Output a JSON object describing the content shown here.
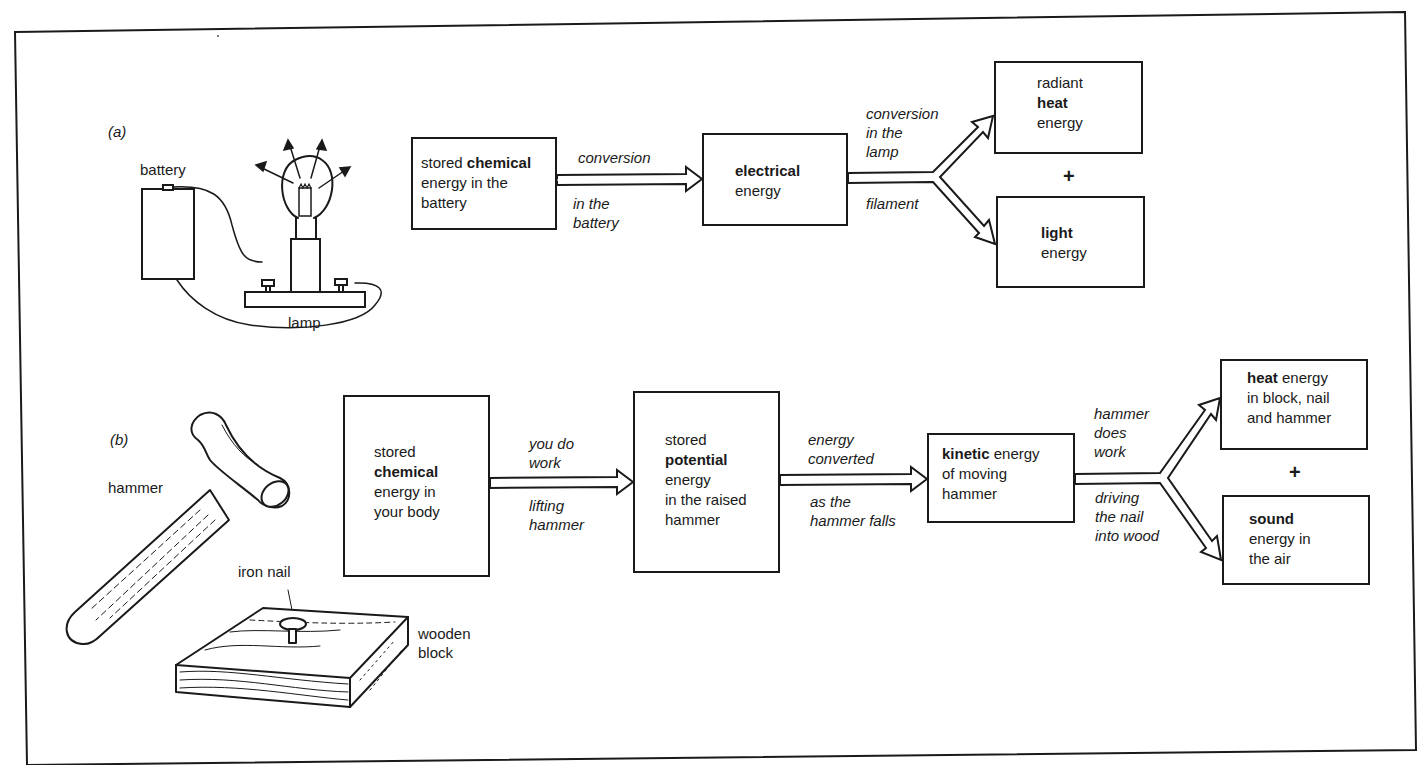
{
  "figure": {
    "part_a": {
      "label": "(a)",
      "apparatus_labels": {
        "battery": "battery",
        "lamp": "lamp"
      },
      "boxes": [
        {
          "id": "a1",
          "lines": [
            {
              "pre": "stored ",
              "bold": "chemical",
              "post": ""
            },
            {
              "pre": "energy in the",
              "bold": "",
              "post": ""
            },
            {
              "pre": "battery",
              "bold": "",
              "post": ""
            }
          ]
        },
        {
          "id": "a2",
          "lines": [
            {
              "pre": "",
              "bold": "electrical",
              "post": ""
            },
            {
              "pre": "energy",
              "bold": "",
              "post": ""
            }
          ]
        },
        {
          "id": "a3",
          "lines": [
            {
              "pre": "radiant",
              "bold": "",
              "post": ""
            },
            {
              "pre": "",
              "bold": "heat",
              "post": ""
            },
            {
              "pre": "energy",
              "bold": "",
              "post": ""
            }
          ]
        },
        {
          "id": "a4",
          "lines": [
            {
              "pre": "",
              "bold": "light",
              "post": ""
            },
            {
              "pre": "energy",
              "bold": "",
              "post": ""
            }
          ]
        }
      ],
      "arrows": [
        {
          "from": "a1",
          "to": "a2",
          "above": [
            "conversion"
          ],
          "below": [
            "in the",
            "battery"
          ]
        },
        {
          "from": "a2",
          "to": [
            "a3",
            "a4"
          ],
          "above": [
            "conversion",
            "in the",
            "lamp"
          ],
          "below": [
            "filament"
          ]
        }
      ],
      "plus": "+"
    },
    "part_b": {
      "label": "(b)",
      "apparatus_labels": {
        "hammer": "hammer",
        "nail": "iron nail",
        "block_1": "wooden",
        "block_2": "block"
      },
      "boxes": [
        {
          "id": "b1",
          "lines": [
            {
              "pre": "stored",
              "bold": "",
              "post": ""
            },
            {
              "pre": "",
              "bold": "chemical",
              "post": ""
            },
            {
              "pre": "energy in",
              "bold": "",
              "post": ""
            },
            {
              "pre": "your body",
              "bold": "",
              "post": ""
            }
          ]
        },
        {
          "id": "b2",
          "lines": [
            {
              "pre": "stored",
              "bold": "",
              "post": ""
            },
            {
              "pre": "",
              "bold": "potential",
              "post": ""
            },
            {
              "pre": "energy",
              "bold": "",
              "post": ""
            },
            {
              "pre": "in the raised",
              "bold": "",
              "post": ""
            },
            {
              "pre": "hammer",
              "bold": "",
              "post": ""
            }
          ]
        },
        {
          "id": "b3",
          "lines": [
            {
              "pre": "",
              "bold": "kinetic",
              "post": " energy"
            },
            {
              "pre": "of moving",
              "bold": "",
              "post": ""
            },
            {
              "pre": "hammer",
              "bold": "",
              "post": ""
            }
          ]
        },
        {
          "id": "b4",
          "lines": [
            {
              "pre": "",
              "bold": "heat",
              "post": " energy"
            },
            {
              "pre": "in block, nail",
              "bold": "",
              "post": ""
            },
            {
              "pre": "and hammer",
              "bold": "",
              "post": ""
            }
          ]
        },
        {
          "id": "b5",
          "lines": [
            {
              "pre": "",
              "bold": "sound",
              "post": ""
            },
            {
              "pre": "energy in",
              "bold": "",
              "post": ""
            },
            {
              "pre": "the air",
              "bold": "",
              "post": ""
            }
          ]
        }
      ],
      "arrows": [
        {
          "from": "b1",
          "to": "b2",
          "above": [
            "you do",
            "work"
          ],
          "below": [
            "lifting",
            "hammer"
          ]
        },
        {
          "from": "b2",
          "to": "b3",
          "above": [
            "energy",
            "converted"
          ],
          "below": [
            "as the",
            "hammer falls"
          ]
        },
        {
          "from": "b3",
          "to": [
            "b4",
            "b5"
          ],
          "above": [
            "hammer",
            "does",
            "work"
          ],
          "below": [
            "driving",
            "the nail",
            "into wood"
          ]
        }
      ],
      "plus": "+"
    },
    "colors": {
      "ink": "#1a1a1a",
      "paper": "#ffffff"
    }
  }
}
